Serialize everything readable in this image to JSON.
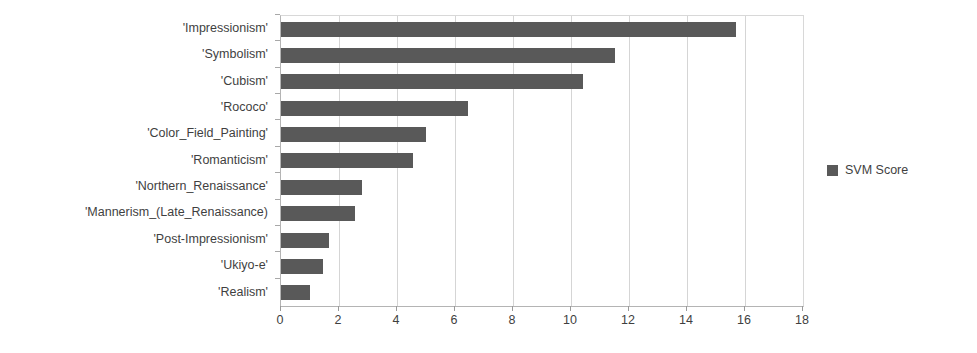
{
  "chart_data": {
    "type": "bar",
    "orientation": "horizontal",
    "title": "",
    "xlabel": "",
    "ylabel": "",
    "xlim": [
      0,
      18
    ],
    "xticks": [
      0,
      2,
      4,
      6,
      8,
      10,
      12,
      14,
      16,
      18
    ],
    "grid": true,
    "grid_axis": "x",
    "legend": {
      "position": "right",
      "entries": [
        {
          "name": "SVM Score",
          "color": "#595959"
        }
      ]
    },
    "series": [
      {
        "name": "SVM Score",
        "color": "#595959",
        "values": [
          15.7,
          11.5,
          10.4,
          6.45,
          5.0,
          4.55,
          2.8,
          2.55,
          1.65,
          1.45,
          1.0
        ]
      }
    ],
    "categories": [
      "'Impressionism'",
      "'Symbolism'",
      "'Cubism'",
      "'Rococo'",
      "'Color_Field_Painting'",
      "'Romanticism'",
      "'Northern_Renaissance'",
      "'Mannerism_(Late_Renaissance)",
      "'Post-Impressionism'",
      "'Ukiyo-e'",
      "'Realism'"
    ]
  },
  "colors": {
    "bar": "#595959",
    "gridline": "#d5d5d5",
    "axis": "#b4b4b4",
    "text": "#3f3f3f",
    "background": "#ffffff"
  }
}
